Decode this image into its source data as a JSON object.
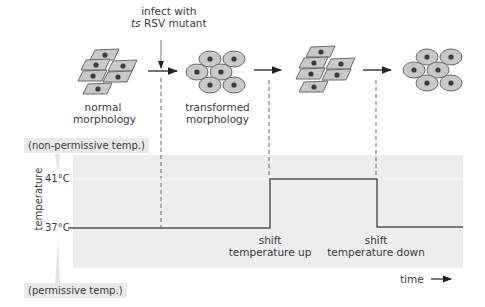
{
  "top": {
    "infect_label_line1": "infect with",
    "infect_label_line2_italic": "ts",
    "infect_label_line2_rest": " RSV mutant",
    "stages": [
      {
        "line1": "normal",
        "line2": "morphology",
        "cell_type": "flat-spindle"
      },
      {
        "line1": "transformed",
        "line2": "morphology",
        "cell_type": "round"
      },
      {
        "line1": "",
        "line2": "",
        "cell_type": "flat-spindle"
      },
      {
        "line1": "",
        "line2": "",
        "cell_type": "round"
      }
    ]
  },
  "graph": {
    "y_axis_title": "temperature",
    "y_ticks": [
      "41°C",
      "37°C"
    ],
    "top_tag": "(non-permissive temp.)",
    "bottom_tag": "(permissive temp.)",
    "shift_up": {
      "line1": "shift",
      "line2": "temperature up"
    },
    "shift_down": {
      "line1": "shift",
      "line2": "temperature down"
    },
    "x_axis_label": "time"
  },
  "colors": {
    "panel": "#ededed",
    "cell_fill": "#c8c8c8",
    "cell_stroke": "#6a6a6a",
    "nucleus": "#3c3c3c",
    "line": "#555555"
  }
}
